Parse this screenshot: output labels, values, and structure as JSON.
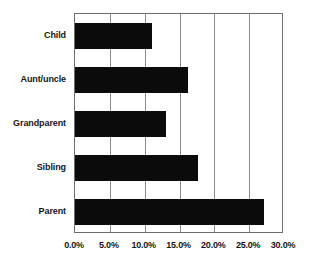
{
  "chart_data": {
    "type": "bar",
    "orientation": "horizontal",
    "title": "",
    "subtitle": "",
    "xlabel": "",
    "ylabel": "",
    "categories": [
      "Parent",
      "Sibling",
      "Grandparent",
      "Aunt/uncle",
      "Child"
    ],
    "values": [
      27.1,
      17.7,
      13.1,
      16.2,
      11.0
    ],
    "series": [
      {
        "name": "",
        "values": [
          27.1,
          17.7,
          13.1,
          16.2,
          11.0
        ]
      }
    ],
    "value_format": "percent",
    "xlim": [
      0,
      30
    ],
    "xtick_values": [
      0,
      5,
      10,
      15,
      20,
      25,
      30
    ],
    "xtick_labels": [
      "0.0%",
      "5.0%",
      "10.0%",
      "15.0%",
      "20.0%",
      "25.0%",
      "30.0%"
    ],
    "grid": {
      "vertical": true,
      "horizontal": false
    },
    "legend": {
      "visible": false,
      "position": "none",
      "entries": []
    },
    "annotations": [],
    "colors": {
      "bar": "#0b0b0b",
      "gridline": "#8a8a8a",
      "frame": "#6d6d6d",
      "text": "#151515",
      "background": "#ffffff"
    }
  }
}
